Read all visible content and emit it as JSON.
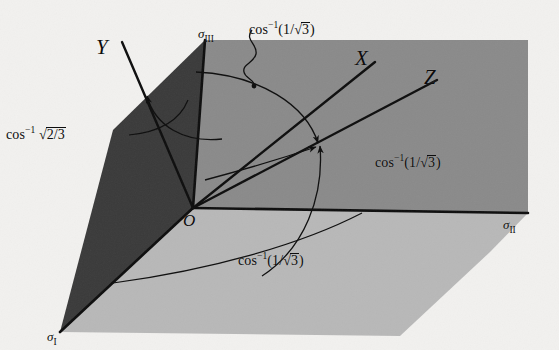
{
  "figure": {
    "background_color": "#f2f1ef",
    "line_color": "#0d0d0d"
  },
  "faces": [
    {
      "name": "left-dark-face",
      "color": "#3a3a3a"
    },
    {
      "name": "right-mid-face",
      "color": "#8a8a8a"
    },
    {
      "name": "bottom-light-face",
      "color": "#b8b8b8"
    }
  ],
  "axes": {
    "principal": [
      {
        "name": "sigma-I",
        "symbol": "σ",
        "subscript": "I",
        "x": 47,
        "y": 330
      },
      {
        "name": "sigma-II",
        "symbol": "σ",
        "subscript": "II",
        "x": 503,
        "y": 218
      },
      {
        "name": "sigma-III",
        "symbol": "σ",
        "subscript": "III",
        "x": 198,
        "y": 27
      }
    ],
    "deviatoric": [
      {
        "name": "axis-X",
        "label": "X",
        "x": 355,
        "y": 48
      },
      {
        "name": "axis-Y",
        "label": "Y",
        "x": 96,
        "y": 37
      },
      {
        "name": "axis-Z",
        "label": "Z",
        "x": 424,
        "y": 67
      }
    ],
    "origin": {
      "name": "origin",
      "label": "O",
      "x": 183,
      "y": 212
    }
  },
  "annotations": [
    {
      "name": "angle-y-axis",
      "fn": "cos",
      "exp": "−1",
      "arg_open": "",
      "radicand": "2/3",
      "arg_close": "",
      "has_radical": true,
      "x": 6,
      "y": 127
    },
    {
      "name": "angle-top-arc",
      "fn": "cos",
      "exp": "−1",
      "arg_open": "(1/",
      "radicand": "3",
      "arg_close": ")",
      "has_radical": true,
      "x": 249,
      "y": 22
    },
    {
      "name": "angle-right-arc",
      "fn": "cos",
      "exp": "−1",
      "arg_open": "(1/",
      "radicand": "3",
      "arg_close": ")",
      "has_radical": true,
      "x": 375,
      "y": 155
    },
    {
      "name": "angle-bottom-arc",
      "fn": "cos",
      "exp": "−1",
      "arg_open": "(1/",
      "radicand": "3",
      "arg_close": ")",
      "has_radical": true,
      "x": 238,
      "y": 253
    }
  ]
}
